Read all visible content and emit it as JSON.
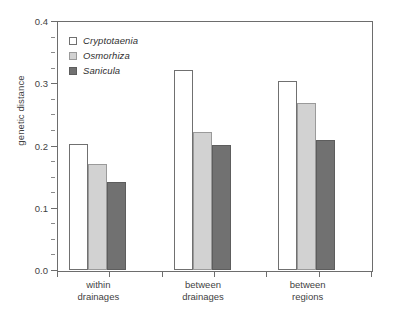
{
  "chart_data": {
    "type": "bar",
    "title": "",
    "subtitle": "",
    "xlabel": "",
    "ylabel": "genetic distance",
    "ylim": [
      0.0,
      0.4
    ],
    "ytick_labels": [
      "0.0",
      "0.1",
      "0.2",
      "0.3",
      "0.4"
    ],
    "ytick_values": [
      0.0,
      0.1,
      0.2,
      0.3,
      0.4
    ],
    "yminor_step": 0.025,
    "grid": false,
    "legend_position": "top-left",
    "categories": [
      "within drainages",
      "between drainages",
      "between regions"
    ],
    "category_lines": [
      [
        "within",
        "drainages"
      ],
      [
        "between",
        "drainages"
      ],
      [
        "between",
        "regions"
      ]
    ],
    "series": [
      {
        "name": "Cryptotaenia",
        "color": "#ffffff",
        "edge": "#707070",
        "values": [
          0.202,
          0.321,
          0.304
        ]
      },
      {
        "name": "Osmorhiza",
        "color": "#d2d2d2",
        "edge": "#9a9a9a",
        "values": [
          0.171,
          0.222,
          0.268
        ]
      },
      {
        "name": "Sanicula",
        "color": "#717171",
        "edge": "#5d5d5d",
        "values": [
          0.142,
          0.201,
          0.209
        ]
      }
    ]
  },
  "legend": {
    "items": [
      {
        "label": "Cryptotaenia"
      },
      {
        "label": "Osmorhiza"
      },
      {
        "label": "Sanicula"
      }
    ]
  },
  "axes": {
    "y_title": "genetic distance"
  }
}
